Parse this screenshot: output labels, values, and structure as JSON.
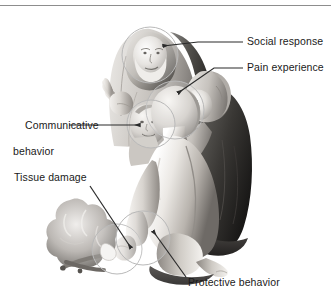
{
  "figure": {
    "type": "medical-illustration",
    "style": "grayscale airbrush illustration",
    "background_color": "#ffffff",
    "has_top_rule": true,
    "annotation_circle_color": "#b9b9b9",
    "leader_line_color": "#2b2b2b",
    "text_color": "#1a1a1a"
  },
  "annotations": [
    {
      "id": "social-response",
      "label": "Social response",
      "side": "right",
      "target": "elder figure's face"
    },
    {
      "id": "pain-experience",
      "label": "Pain experience",
      "side": "right",
      "target": "injured person's head"
    },
    {
      "id": "communicative-behavior",
      "label_line1": "Communicative",
      "label_line2": "behavior",
      "side": "left",
      "target": "child's face"
    },
    {
      "id": "tissue-damage",
      "label": "Tissue damage",
      "side": "left",
      "target": "burned hand near the campfire"
    },
    {
      "id": "protective-behavior",
      "label": "Protective behavior",
      "side": "bottom",
      "target": "hand guarding the injury"
    }
  ]
}
